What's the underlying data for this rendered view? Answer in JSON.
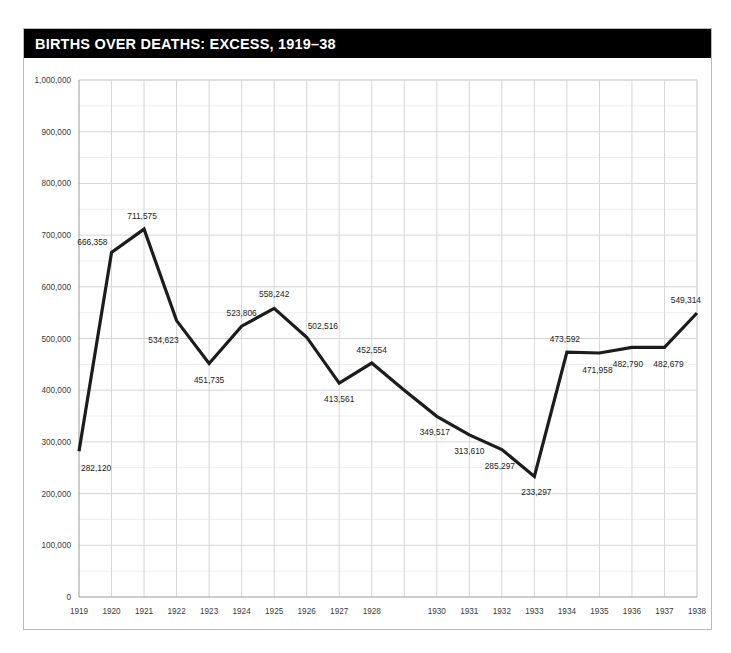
{
  "card": {
    "title": "BIRTHS OVER DEATHS: EXCESS, 1919–38"
  },
  "colors": {
    "header_bg": "#000000",
    "header_text": "#ffffff",
    "line": "#1c1c1c",
    "grid_major": "#d6d6d6",
    "grid_minor": "#ededed",
    "axis": "#9a9a9a",
    "card_border": "#b9b9b9",
    "background": "#ffffff"
  },
  "chart_data": {
    "type": "line",
    "title": "BIRTHS OVER DEATHS: EXCESS, 1919–38",
    "xlabel": "",
    "ylabel": "",
    "grid": true,
    "legend": "none",
    "xlim": [
      1919,
      1938
    ],
    "ylim": [
      0,
      1000000
    ],
    "y_major_step": 100000,
    "y_minor_step": 50000,
    "categories": [
      "1919",
      "1920",
      "1921",
      "1922",
      "1923",
      "1924",
      "1925",
      "1926",
      "1927",
      "1928",
      "1929",
      "1930",
      "1931",
      "1932",
      "1933",
      "1934",
      "1935",
      "1936",
      "1937",
      "1938"
    ],
    "x_tick_labels": [
      "1919",
      "1920",
      "1921",
      "1922",
      "1923",
      "1924",
      "1925",
      "1926",
      "1927",
      "1928",
      "",
      "1930",
      "1931",
      "1932",
      "1933",
      "1934",
      "1935",
      "1936",
      "1937",
      "1938"
    ],
    "y_tick_labels": [
      "0",
      "100,000",
      "200,000",
      "300,000",
      "400,000",
      "500,000",
      "600,000",
      "700,000",
      "800,000",
      "900,000",
      "1,000,000"
    ],
    "y_tick_values": [
      0,
      100000,
      200000,
      300000,
      400000,
      500000,
      600000,
      700000,
      800000,
      900000,
      1000000
    ],
    "series": [
      {
        "name": "Excess of births over deaths",
        "values": [
          282120,
          666358,
          711575,
          534623,
          451735,
          523806,
          558242,
          502516,
          413561,
          452554,
          400000,
          349517,
          313610,
          285297,
          233297,
          473592,
          471958,
          482790,
          482679,
          549314
        ]
      }
    ],
    "point_labels": [
      {
        "year": "1919",
        "value": 282120,
        "text": "282,120",
        "anchor": "start",
        "dx": 2,
        "dy": 20
      },
      {
        "year": "1920",
        "value": 666358,
        "text": "666,358",
        "anchor": "end",
        "dx": -4,
        "dy": -7
      },
      {
        "year": "1921",
        "value": 711575,
        "text": "711,575",
        "anchor": "middle",
        "dx": -2,
        "dy": -10
      },
      {
        "year": "1922",
        "value": 534623,
        "text": "534,623",
        "anchor": "end",
        "dx": 2,
        "dy": 22
      },
      {
        "year": "1923",
        "value": 451735,
        "text": "451,735",
        "anchor": "middle",
        "dx": 0,
        "dy": 20
      },
      {
        "year": "1924",
        "value": 523806,
        "text": "523,806",
        "anchor": "middle",
        "dx": 0,
        "dy": -10
      },
      {
        "year": "1925",
        "value": 558242,
        "text": "558,242",
        "anchor": "middle",
        "dx": 0,
        "dy": -11
      },
      {
        "year": "1926",
        "value": 502516,
        "text": "502,516",
        "anchor": "start",
        "dx": 1,
        "dy": -8
      },
      {
        "year": "1927",
        "value": 413561,
        "text": "413,561",
        "anchor": "middle",
        "dx": 0,
        "dy": 19
      },
      {
        "year": "1928",
        "value": 452554,
        "text": "452,554",
        "anchor": "middle",
        "dx": 0,
        "dy": -10
      },
      {
        "year": "1930",
        "value": 349517,
        "text": "349,517",
        "anchor": "middle",
        "dx": -2,
        "dy": 19
      },
      {
        "year": "1931",
        "value": 313610,
        "text": "313,610",
        "anchor": "middle",
        "dx": 0,
        "dy": 19
      },
      {
        "year": "1932",
        "value": 285297,
        "text": "285,297",
        "anchor": "middle",
        "dx": -2,
        "dy": 19
      },
      {
        "year": "1933",
        "value": 233297,
        "text": "233,297",
        "anchor": "middle",
        "dx": 2,
        "dy": 19
      },
      {
        "year": "1934",
        "value": 473592,
        "text": "473,592",
        "anchor": "middle",
        "dx": -2,
        "dy": -10
      },
      {
        "year": "1935",
        "value": 471958,
        "text": "471,958",
        "anchor": "middle",
        "dx": -2,
        "dy": 20
      },
      {
        "year": "1936",
        "value": 482790,
        "text": "482,790",
        "anchor": "middle",
        "dx": -4,
        "dy": 20
      },
      {
        "year": "1937",
        "value": 482679,
        "text": "482,679",
        "anchor": "middle",
        "dx": 4,
        "dy": 20
      },
      {
        "year": "1938",
        "value": 549314,
        "text": "549,314",
        "anchor": "end",
        "dx": 4,
        "dy": -10
      }
    ]
  }
}
